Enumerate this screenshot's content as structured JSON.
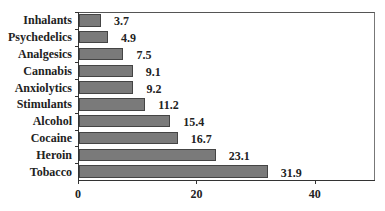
{
  "chart_data": {
    "type": "bar",
    "orientation": "horizontal",
    "title": "",
    "xlabel": "",
    "ylabel": "",
    "categories": [
      "Inhalants",
      "Psychedelics",
      "Analgesics",
      "Cannabis",
      "Anxiolytics",
      "Stimulants",
      "Alcohol",
      "Cocaine",
      "Heroin",
      "Tobacco"
    ],
    "values": [
      3.7,
      4.9,
      7.5,
      9.1,
      9.2,
      11.2,
      15.4,
      16.7,
      23.1,
      31.9
    ],
    "value_labels": [
      "3.7",
      "4.9",
      "7.5",
      "9.1",
      "9.2",
      "11.2",
      "15.4",
      "16.7",
      "23.1",
      "31.9"
    ],
    "xlim": [
      0,
      50
    ],
    "x_ticks": [
      0,
      20,
      40
    ],
    "x_tick_labels": [
      "0",
      "20",
      "40"
    ],
    "grid": false,
    "legend": null,
    "bar_color": "#7a7a7a",
    "bar_border_color": "#444444"
  }
}
